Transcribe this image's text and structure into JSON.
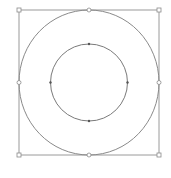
{
  "canvas": {
    "width": 171,
    "height": 178,
    "background": "#ffffff"
  },
  "selection_box": {
    "x": 19,
    "y": 10,
    "width": 140,
    "height": 145,
    "stroke": "#9a9a9a"
  },
  "outer_circle": {
    "cx": 89,
    "cy": 82.5,
    "rx": 70,
    "ry": 72.5,
    "stroke": "#8a8a8a"
  },
  "inner_circle": {
    "cx": 89,
    "cy": 82.5,
    "r": 38.5,
    "stroke": "#7a7a7a"
  },
  "handles": {
    "style": "hollow-square",
    "color": "#8a8a8a"
  },
  "anchor_points": {
    "style": "filled-dot",
    "color": "#555555"
  }
}
